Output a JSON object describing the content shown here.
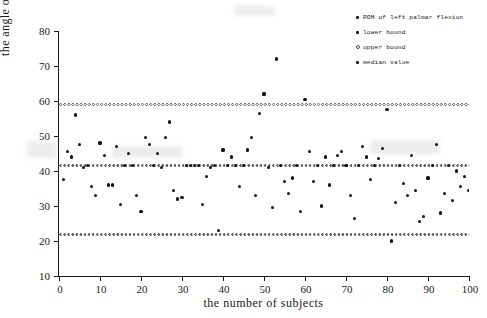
{
  "chart_data": {
    "type": "scatter",
    "title": "",
    "xlabel": "the number of subjects",
    "ylabel": "the angle of left palmar flexion(degree)",
    "xlim": [
      0,
      100
    ],
    "ylim": [
      10,
      80
    ],
    "xticks": [
      0,
      10,
      20,
      30,
      40,
      50,
      60,
      70,
      80,
      90,
      100
    ],
    "yticks": [
      10,
      20,
      30,
      40,
      50,
      60,
      70,
      80
    ],
    "grid": false,
    "legend_position": "top-right",
    "legend": [
      {
        "marker": "dot",
        "label": "ROM of left palmar flexion"
      },
      {
        "marker": "dot",
        "label": "lower bound"
      },
      {
        "marker": "ring",
        "label": "upper bound"
      },
      {
        "marker": "dot",
        "label": "median value"
      }
    ],
    "reference_lines": [
      {
        "name": "upper bound",
        "value": 59.0,
        "style": "dotted-ring"
      },
      {
        "name": "median value",
        "value": 41.5,
        "style": "dotted"
      },
      {
        "name": "lower bound",
        "value": 22.0,
        "style": "dotted"
      }
    ],
    "series": [
      {
        "name": "ROM of left palmar flexion",
        "marker": "dot",
        "x": [
          1,
          2,
          3,
          4,
          5,
          6,
          7,
          8,
          9,
          10,
          11,
          12,
          13,
          14,
          15,
          16,
          17,
          18,
          19,
          20,
          21,
          22,
          23,
          24,
          25,
          26,
          27,
          28,
          29,
          30,
          31,
          32,
          33,
          34,
          35,
          36,
          37,
          38,
          39,
          40,
          41,
          42,
          43,
          44,
          45,
          46,
          47,
          48,
          49,
          50,
          51,
          52,
          53,
          54,
          55,
          56,
          57,
          58,
          59,
          60,
          61,
          62,
          63,
          64,
          65,
          66,
          67,
          68,
          69,
          70,
          71,
          72,
          73,
          74,
          75,
          76,
          77,
          78,
          79,
          80,
          81,
          82,
          83,
          84,
          85,
          86,
          87,
          88,
          89,
          90,
          91,
          92,
          93,
          94,
          95,
          96,
          97,
          98,
          99,
          100
        ],
        "y": [
          37.5,
          45.5,
          44.0,
          56.0,
          47.5,
          41.0,
          41.5,
          35.5,
          33.0,
          48.0,
          44.5,
          36.0,
          36.0,
          47.0,
          30.5,
          41.5,
          45.0,
          41.5,
          33.0,
          28.5,
          49.5,
          47.5,
          41.5,
          45.0,
          41.0,
          49.5,
          54.0,
          34.5,
          32.0,
          32.5,
          41.5,
          41.5,
          41.5,
          41.5,
          30.5,
          38.5,
          41.0,
          41.5,
          23.0,
          46.0,
          41.5,
          44.0,
          41.5,
          35.5,
          41.5,
          46.0,
          49.5,
          33.0,
          56.5,
          62.0,
          41.0,
          29.5,
          72.0,
          41.5,
          37.0,
          33.5,
          38.0,
          41.5,
          28.5,
          60.5,
          45.5,
          37.0,
          41.5,
          30.0,
          44.0,
          36.0,
          41.5,
          44.5,
          45.5,
          41.5,
          33.0,
          26.5,
          41.5,
          47.0,
          44.0,
          37.5,
          41.5,
          43.5,
          46.5,
          57.5,
          20.0,
          31.0,
          41.5,
          36.5,
          33.0,
          44.5,
          34.5,
          25.5,
          27.0,
          38.0,
          41.5,
          47.5,
          28.0,
          33.5,
          41.5,
          31.5,
          40.0,
          35.5,
          38.5,
          34.5
        ]
      }
    ]
  }
}
